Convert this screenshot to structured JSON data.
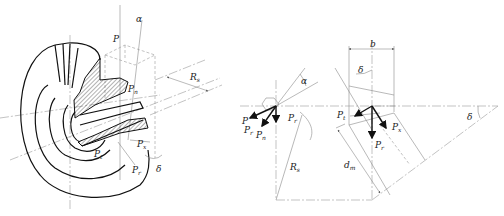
{
  "figure": {
    "left_view": {
      "description": "Isometric cutaway of bevel gear with force components",
      "labels": {
        "P": "P",
        "alpha": "α",
        "Pn": "P",
        "Pn_sub": "n",
        "Rs": "R",
        "Rs_sub": "s",
        "Pt": "P",
        "Pt_sub": "t",
        "Px": "P",
        "Px_sub": "x",
        "Pr": "P",
        "Pr_sub": "r",
        "delta": "δ"
      }
    },
    "middle_view": {
      "description": "Force vector diagram at tooth contact",
      "labels": {
        "P": "P",
        "Pr_left": "P",
        "Pr_left_sub": "r",
        "Pn": "P",
        "Pn_sub": "n",
        "alpha": "α",
        "Pr": "P",
        "Pr_sub": "r",
        "Rs": "R",
        "Rs_sub": "s"
      }
    },
    "right_view": {
      "description": "Side section of bevel gear with face width and pitch cone",
      "labels": {
        "b": "b",
        "delta_top": "δ",
        "Pt": "P",
        "Pt_sub": "t",
        "Px": "P",
        "Px_sub": "x",
        "Pr": "P",
        "Pr_sub": "r",
        "dm": "d",
        "dm_sub": "m",
        "delta_right": "δ"
      }
    }
  }
}
